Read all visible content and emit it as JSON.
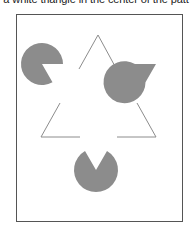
{
  "caption": "a white triangle in the center of the patt",
  "figure": {
    "frame_color": "#555555",
    "pacman_color": "#8c8c8c",
    "line_color": "#8c8c8c",
    "pacmen": [
      {
        "name": "top-left",
        "cx": 42,
        "cy": 64,
        "r": 21,
        "mouth": "lower-right"
      },
      {
        "name": "top-right",
        "cx": 156,
        "cy": 64,
        "r": 21,
        "mouth": "lower-left"
      },
      {
        "name": "bottom",
        "cx": 96,
        "cy": 170,
        "r": 22,
        "mouth": "up"
      }
    ],
    "outline_triangle": "inverted, partially occluded"
  }
}
